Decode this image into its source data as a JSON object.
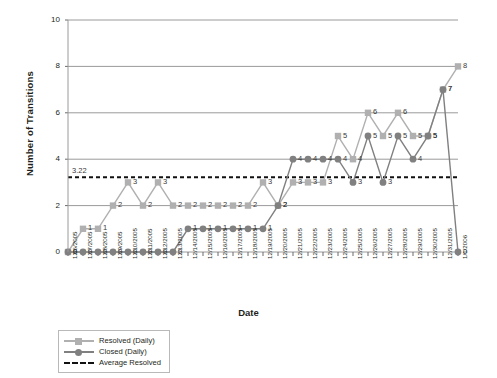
{
  "chart_data": {
    "type": "line",
    "title": "",
    "xlabel": "Date",
    "ylabel": "Number of Transitions",
    "ylim": [
      0,
      10
    ],
    "yticks": [
      0,
      2,
      4,
      6,
      8,
      10
    ],
    "grid": true,
    "legend_position": "bottom-left",
    "categories": [
      "12/6/2005",
      "12/7/2005",
      "12/8/2005",
      "12/9/2005",
      "12/10/2005",
      "12/11/2005",
      "12/12/2005",
      "12/13/2005",
      "12/14/2005",
      "12/15/2005",
      "12/16/2005",
      "12/17/2005",
      "12/18/2005",
      "12/19/2005",
      "12/20/2005",
      "12/21/2005",
      "12/22/2005",
      "12/23/2005",
      "12/24/2005",
      "12/25/2005",
      "12/26/2005",
      "12/27/2005",
      "12/28/2005",
      "12/29/2005",
      "12/30/2005",
      "12/31/2005",
      "1/1/2006"
    ],
    "series": [
      {
        "name": "Resolved (Daily)",
        "marker": "square",
        "color": "#b0b0b0",
        "values": [
          0,
          1,
          1,
          2,
          3,
          2,
          3,
          2,
          2,
          2,
          2,
          2,
          2,
          3,
          2,
          3,
          3,
          3,
          5,
          4,
          6,
          5,
          6,
          5,
          5,
          7,
          8
        ],
        "labels": [
          "0",
          "1",
          "1",
          "2",
          "3",
          "2",
          "3",
          "2",
          "2",
          "2",
          "2",
          "2",
          "2",
          "3",
          "2",
          "3",
          "3",
          "3",
          "5",
          "4",
          "6",
          "5",
          "6",
          "5",
          "5",
          "7",
          "8"
        ]
      },
      {
        "name": "Closed (Daily)",
        "marker": "circle",
        "color": "#808080",
        "values": [
          0,
          0,
          0,
          0,
          0,
          0,
          0,
          0,
          1,
          1,
          1,
          1,
          1,
          1,
          2,
          4,
          4,
          4,
          4,
          3,
          5,
          3,
          5,
          4,
          5,
          7,
          0
        ],
        "labels": [
          "0",
          "0",
          "0",
          "0",
          "0",
          "0",
          "0",
          "0",
          "1",
          "1",
          "1",
          "1",
          "1",
          "1",
          "2",
          "4",
          "4",
          "4",
          "4",
          "3",
          "5",
          "3",
          "5",
          "4",
          "5",
          "7",
          "0"
        ]
      }
    ],
    "average_line": {
      "name": "Average Resolved",
      "value": 3.22,
      "label": "3.22",
      "style": "dashed",
      "color": "#111111"
    }
  },
  "legend": {
    "items": [
      {
        "label": "Resolved (Daily)"
      },
      {
        "label": "Closed (Daily)"
      },
      {
        "label": "Average Resolved"
      }
    ]
  }
}
